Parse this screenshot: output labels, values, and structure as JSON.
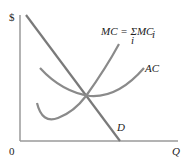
{
  "diagram": {
    "type": "economics-cost-curves",
    "axes": {
      "y_label": "$",
      "x_label": "Q",
      "origin_label": "0"
    },
    "curves": [
      {
        "id": "mc",
        "label": "MC = ΣMC",
        "label_main": "MC = ΣMC",
        "label_subscript": "i",
        "label_under_sigma": "i",
        "color": "#8a8a8a"
      },
      {
        "id": "ac",
        "label": "AC",
        "color": "#8a8a8a"
      },
      {
        "id": "d",
        "label": "D",
        "color": "#7a7a7a"
      }
    ],
    "intersection": "MC, AC and D intersect at the minimum of AC"
  }
}
